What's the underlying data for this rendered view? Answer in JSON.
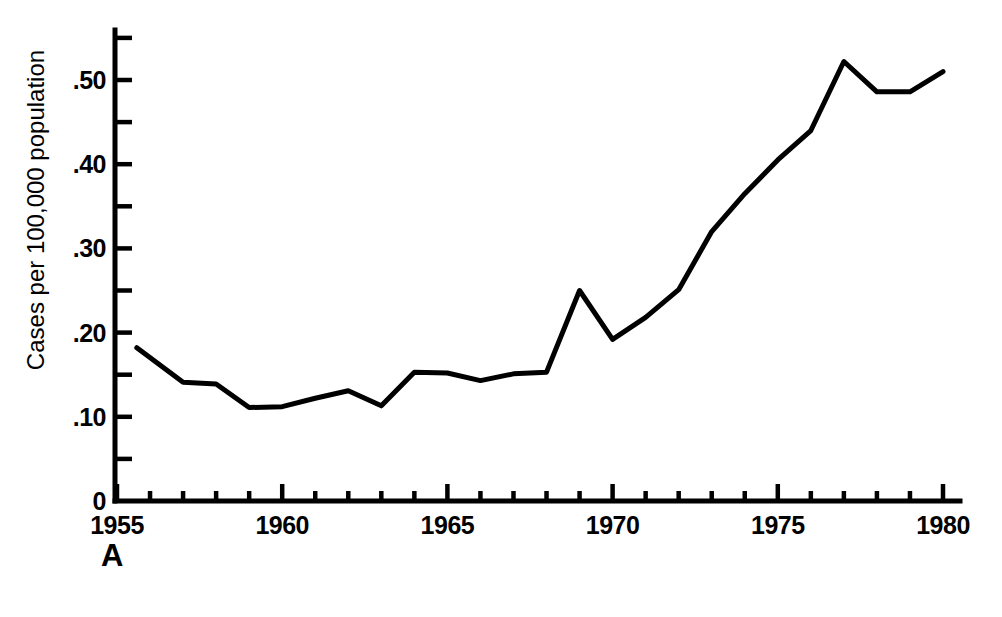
{
  "figure": {
    "panel_label": "A",
    "background_color": "#ffffff",
    "line_color": "#000000",
    "axis_color": "#000000"
  },
  "chart_data": {
    "type": "line",
    "title": "",
    "subtitle": "",
    "xlabel": "",
    "ylabel": "Cases per 100,000 population",
    "xlim": [
      1955,
      1980.6
    ],
    "ylim": [
      0,
      0.555
    ],
    "grid": false,
    "legend": null,
    "x_major_ticks": [
      1955,
      1960,
      1965,
      1970,
      1975,
      1980
    ],
    "x_major_tick_labels": [
      "1955",
      "1960",
      "1965",
      "1970",
      "1975",
      "1980"
    ],
    "x_minor_ticks": [
      1956,
      1957,
      1958,
      1959,
      1961,
      1962,
      1963,
      1964,
      1966,
      1967,
      1968,
      1969,
      1971,
      1972,
      1973,
      1974,
      1976,
      1977,
      1978,
      1979
    ],
    "y_major_ticks": [
      0,
      0.1,
      0.2,
      0.3,
      0.4,
      0.5
    ],
    "y_major_tick_labels": [
      "0",
      ".10",
      ".20",
      ".30",
      ".40",
      ".50"
    ],
    "y_minor_ticks": [
      0.05,
      0.15,
      0.25,
      0.35,
      0.45,
      0.55
    ],
    "x": [
      1955.6,
      1957,
      1958,
      1959,
      1960,
      1961,
      1962,
      1963,
      1964,
      1965,
      1966,
      1967,
      1968,
      1969,
      1970,
      1971,
      1972,
      1973,
      1974,
      1975,
      1976,
      1977,
      1978,
      1979,
      1980
    ],
    "values": [
      0.182,
      0.141,
      0.139,
      0.111,
      0.112,
      0.122,
      0.131,
      0.113,
      0.153,
      0.152,
      0.143,
      0.151,
      0.153,
      0.25,
      0.192,
      0.218,
      0.251,
      0.32,
      0.365,
      0.405,
      0.44,
      0.522,
      0.486,
      0.486,
      0.51
    ],
    "series": [
      {
        "name": "Cases per 100,000 population",
        "values": [
          0.182,
          0.141,
          0.139,
          0.111,
          0.112,
          0.122,
          0.131,
          0.113,
          0.153,
          0.152,
          0.143,
          0.151,
          0.153,
          0.25,
          0.192,
          0.218,
          0.251,
          0.32,
          0.365,
          0.405,
          0.44,
          0.522,
          0.486,
          0.486,
          0.51
        ]
      }
    ]
  },
  "axes": {
    "y_labels": [
      {
        "text": ".50",
        "value": 0.5
      },
      {
        "text": ".40",
        "value": 0.4
      },
      {
        "text": ".30",
        "value": 0.3
      },
      {
        "text": ".20",
        "value": 0.2
      },
      {
        "text": ".10",
        "value": 0.1
      },
      {
        "text": "0",
        "value": 0
      }
    ],
    "x_labels": [
      {
        "text": "1955",
        "value": 1955
      },
      {
        "text": "1960",
        "value": 1960
      },
      {
        "text": "1965",
        "value": 1965
      },
      {
        "text": "1970",
        "value": 1970
      },
      {
        "text": "1975",
        "value": 1975
      },
      {
        "text": "1980",
        "value": 1980
      }
    ]
  }
}
